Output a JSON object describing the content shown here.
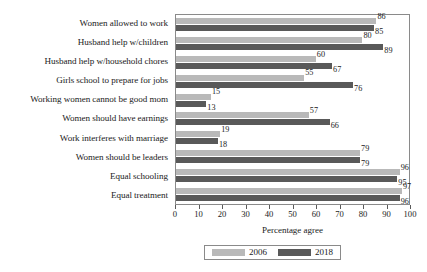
{
  "chart_data": {
    "type": "bar",
    "orientation": "horizontal",
    "title": "",
    "subtitle": "",
    "xlabel": "Percentage agree",
    "ylabel": "",
    "xlim": [
      0,
      100
    ],
    "xticks": [
      0,
      10,
      20,
      30,
      40,
      50,
      60,
      70,
      80,
      90,
      100
    ],
    "grid": false,
    "legend_position": "bottom",
    "categories": [
      "Women allowed to work",
      "Husband help w/children",
      "Husband help w/household chores",
      "Girls school to prepare for jobs",
      "Working women cannot be good mom",
      "Women should have earnings",
      "Work interferes with marriage",
      "Women should be leaders",
      "Equal schooling",
      "Equal treatment"
    ],
    "series": [
      {
        "name": "2006",
        "color": "#b9b9b9",
        "values": [
          86,
          80,
          60,
          55,
          15,
          57,
          19,
          79,
          96,
          97
        ]
      },
      {
        "name": "2018",
        "color": "#595959",
        "values": [
          85,
          89,
          67,
          76,
          13,
          66,
          18,
          79,
          95,
          96
        ]
      }
    ]
  },
  "legend": {
    "entries": [
      {
        "label": "2006"
      },
      {
        "label": "2018"
      }
    ]
  }
}
